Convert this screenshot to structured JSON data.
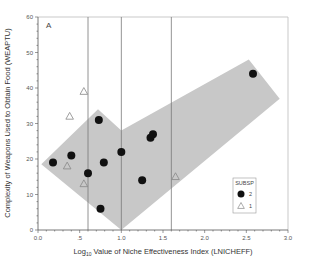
{
  "chart_data": {
    "type": "scatter",
    "panel_label": "A",
    "title": "",
    "xlabel_prefix": "Log",
    "xlabel_sub": "10",
    "xlabel_rest": " Value of Niche Effectiveness Index (LNICHEFF)",
    "xlabel": "Log10 Value of Niche Effectiveness Index (LNICHEFF)",
    "ylabel": "Complexity of Weapons Used to Obtain Food (WEAPTU)",
    "xlim": [
      0.0,
      3.0
    ],
    "ylim": [
      0,
      60
    ],
    "x_ticks": [
      0.0,
      0.5,
      1.0,
      1.5,
      2.0,
      2.5,
      3.0
    ],
    "x_tick_labels": [
      "0.0",
      ".5",
      "1.0",
      "1.5",
      "2.0",
      "2.5",
      "3.0"
    ],
    "y_ticks": [
      0,
      10,
      20,
      30,
      40,
      50,
      60
    ],
    "y_tick_labels": [
      "0",
      "10",
      "20",
      "30",
      "40",
      "50",
      "60"
    ],
    "grid": false,
    "reference_lines_x": [
      0.6,
      1.0,
      1.6
    ],
    "shaded_region": [
      [
        0.04,
        18.5
      ],
      [
        0.72,
        34
      ],
      [
        1.0,
        28
      ],
      [
        2.53,
        48
      ],
      [
        2.9,
        37
      ],
      [
        1.0,
        0
      ]
    ],
    "legend": {
      "title": "SUBSP",
      "position": "lower right",
      "entries": [
        {
          "label": "2",
          "marker": "filled-circle"
        },
        {
          "label": "1",
          "marker": "open-triangle"
        }
      ]
    },
    "series": [
      {
        "name": "2",
        "marker": "filled-circle",
        "color": "#111111",
        "points": [
          [
            0.18,
            19
          ],
          [
            0.4,
            21
          ],
          [
            0.6,
            16
          ],
          [
            0.73,
            31
          ],
          [
            0.79,
            19
          ],
          [
            0.75,
            6
          ],
          [
            1.0,
            22
          ],
          [
            1.25,
            14
          ],
          [
            1.35,
            26
          ],
          [
            1.38,
            27
          ],
          [
            2.58,
            44
          ]
        ]
      },
      {
        "name": "1",
        "marker": "open-triangle",
        "color": "#888888",
        "points": [
          [
            0.55,
            39
          ],
          [
            0.38,
            32
          ],
          [
            0.35,
            18
          ],
          [
            0.55,
            13
          ],
          [
            1.65,
            15
          ]
        ]
      }
    ]
  },
  "colors": {
    "shade": "#c8c8c8",
    "axis": "#555555",
    "ref_line": "#777777",
    "box": "#bbbbbb"
  }
}
